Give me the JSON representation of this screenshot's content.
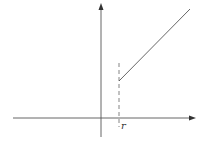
{
  "diagram": {
    "type": "piecewise-graph",
    "colors": {
      "axis": "#555555",
      "line": "#555555",
      "dashed": "#777777",
      "background": "#ffffff"
    },
    "axes": {
      "x_axis": {
        "y": 118,
        "x_start": 13,
        "x_end": 195,
        "arrow": true
      },
      "y_axis": {
        "x": 101,
        "y_start": 137,
        "y_end": 4,
        "arrow": true
      }
    },
    "dashed_line": {
      "x": 119,
      "y_start": 63,
      "y_end": 127
    },
    "ray": {
      "x1": 119,
      "y1": 81,
      "x2": 190,
      "y2": 9
    },
    "labels": {
      "r": "r"
    }
  }
}
